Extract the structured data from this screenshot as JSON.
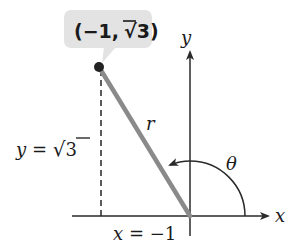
{
  "diagram": {
    "point_label": {
      "open": "(",
      "x": "−1,",
      "radical": "√",
      "y": "3",
      "close": ")"
    },
    "y_equation": {
      "var": "y",
      "eq": " = ",
      "radical": "√",
      "value": "3"
    },
    "x_equation": {
      "var": "x",
      "eq": " = −1"
    },
    "axis_labels": {
      "x": "x",
      "y": "y"
    },
    "radius_label": "r",
    "angle_label": "θ",
    "colors": {
      "axis": "#2a2a2a",
      "radius_line": "#8a8a8a",
      "callout_bg": "#e3e3e3",
      "point": "#222222",
      "dashed": "#333333"
    },
    "point": {
      "x": -1,
      "y_symbolic": "√3"
    }
  }
}
